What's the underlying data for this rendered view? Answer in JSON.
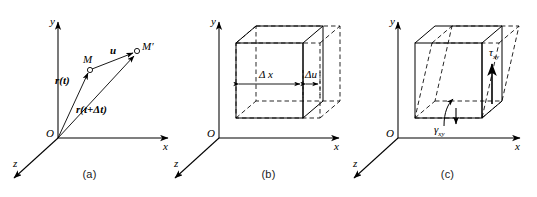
{
  "figure": {
    "panels": [
      {
        "id": "a",
        "caption": "(a)",
        "axes": {
          "y": "y",
          "x": "x",
          "z": "z",
          "origin": "O"
        },
        "points": {
          "m": "M",
          "m_prime": "M′"
        },
        "vectors": {
          "displacement": "u",
          "position_t": "r(t)",
          "position_t_dt": "r(t+Δt)"
        }
      },
      {
        "id": "b",
        "caption": "(b)",
        "axes": {
          "y": "y",
          "x": "x",
          "z": "z",
          "origin": "O"
        },
        "dimensions": {
          "original_length": "Δ x",
          "elongation": "Δu"
        }
      },
      {
        "id": "c",
        "caption": "(c)",
        "axes": {
          "y": "y",
          "x": "x",
          "z": "z",
          "origin": "O"
        },
        "labels": {
          "shear_stress": "τ",
          "shear_stress_sub": "xy",
          "shear_angle": "γ",
          "shear_angle_sub": "xy"
        }
      }
    ],
    "style": {
      "stroke": "#000000",
      "dashed_stroke": "#000000",
      "background": "#ffffff"
    }
  }
}
